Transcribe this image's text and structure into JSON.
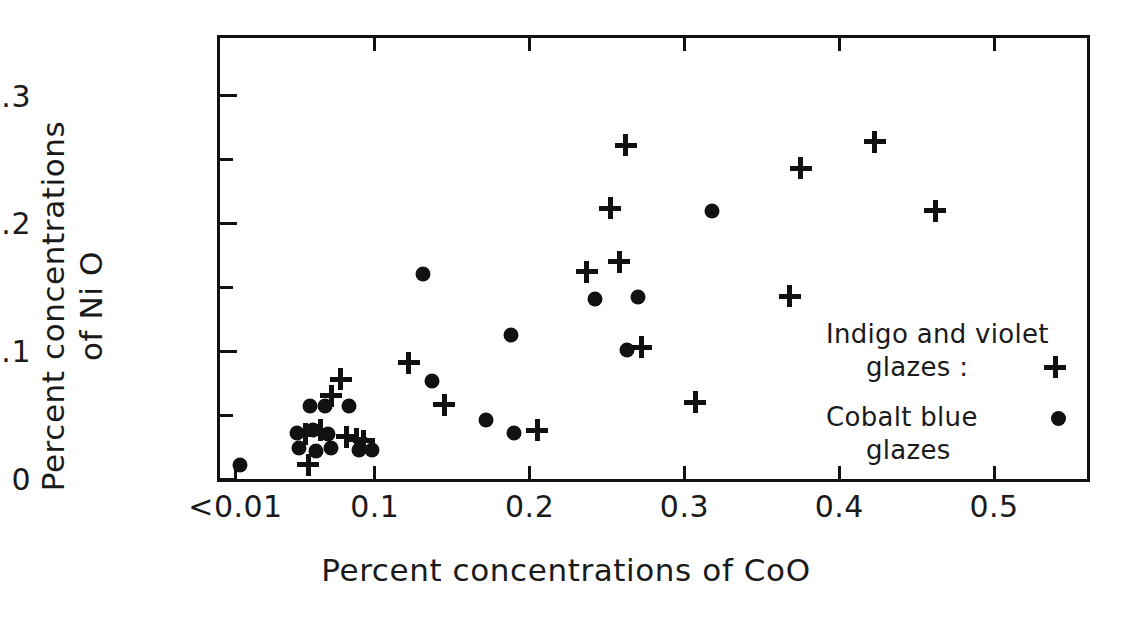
{
  "chart_data": {
    "type": "scatter",
    "title": "",
    "xlabel": "Percent concentrations of CoO",
    "ylabel_line1": "Percent concentrations",
    "ylabel_line2": "of Ni O",
    "xlim": [
      0.0,
      0.56
    ],
    "ylim": [
      0.0,
      0.345
    ],
    "grid": false,
    "legend_position": "right-inside",
    "xticks": [
      0.01,
      0.1,
      0.2,
      0.3,
      0.4,
      0.5
    ],
    "xticklabels": [
      "<0.01",
      "0.1",
      "0.2",
      "0.3",
      "0.4",
      "0.5"
    ],
    "yticks": [
      0,
      0.1,
      0.2,
      0.3
    ],
    "yticklabels": [
      "0",
      "0.1",
      "0.2",
      "0.3"
    ],
    "yminorticks": [
      0.05,
      0.15,
      0.25
    ],
    "xtopticks": [
      0.1,
      0.2,
      0.3,
      0.4,
      0.5
    ],
    "series": [
      {
        "name": "Indigo and violet glazes",
        "marker": "plus",
        "points": [
          [
            0.055,
            0.035
          ],
          [
            0.057,
            0.011
          ],
          [
            0.065,
            0.038
          ],
          [
            0.072,
            0.065
          ],
          [
            0.078,
            0.078
          ],
          [
            0.082,
            0.033
          ],
          [
            0.088,
            0.031
          ],
          [
            0.093,
            0.03
          ],
          [
            0.122,
            0.091
          ],
          [
            0.145,
            0.058
          ],
          [
            0.205,
            0.038
          ],
          [
            0.237,
            0.162
          ],
          [
            0.252,
            0.212
          ],
          [
            0.258,
            0.17
          ],
          [
            0.262,
            0.261
          ],
          [
            0.272,
            0.103
          ],
          [
            0.307,
            0.06
          ],
          [
            0.368,
            0.143
          ],
          [
            0.375,
            0.243
          ],
          [
            0.423,
            0.264
          ],
          [
            0.462,
            0.21
          ]
        ]
      },
      {
        "name": "Cobalt blue glazes",
        "marker": "dot",
        "points": [
          [
            0.013,
            0.011
          ],
          [
            0.05,
            0.036
          ],
          [
            0.051,
            0.024
          ],
          [
            0.058,
            0.057
          ],
          [
            0.06,
            0.038
          ],
          [
            0.062,
            0.022
          ],
          [
            0.068,
            0.057
          ],
          [
            0.07,
            0.035
          ],
          [
            0.072,
            0.024
          ],
          [
            0.083,
            0.057
          ],
          [
            0.09,
            0.023
          ],
          [
            0.098,
            0.023
          ],
          [
            0.131,
            0.16
          ],
          [
            0.137,
            0.077
          ],
          [
            0.172,
            0.046
          ],
          [
            0.188,
            0.113
          ],
          [
            0.19,
            0.036
          ],
          [
            0.242,
            0.141
          ],
          [
            0.263,
            0.101
          ],
          [
            0.27,
            0.142
          ],
          [
            0.318,
            0.21
          ]
        ]
      }
    ]
  },
  "legend": {
    "entries": [
      {
        "line1": "Indigo and violet",
        "line2": "glazes :",
        "symbol": "plus-marker"
      },
      {
        "line1": "Cobalt blue",
        "line2": "glazes",
        "symbol": "dot-marker"
      }
    ]
  }
}
